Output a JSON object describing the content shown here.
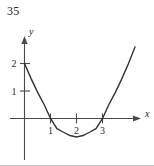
{
  "figure": {
    "number_label": "35",
    "axis_labels": {
      "x": "x",
      "y": "y"
    },
    "x_tick_labels": [
      "1",
      "2",
      "3"
    ],
    "y_tick_labels": [
      "1",
      "2"
    ],
    "colors": {
      "curve": "#333333",
      "axis": "#4a4a4a",
      "text": "#252525",
      "background": "#ffffff",
      "rule": "#c9c9c9"
    }
  },
  "chart_data": {
    "type": "line",
    "title": "",
    "subtitle": "",
    "xlabel": "x",
    "ylabel": "y",
    "xlim": [
      -0.55,
      4.5
    ],
    "ylim": [
      -1.6,
      2.95
    ],
    "xticks": [
      1,
      2,
      3
    ],
    "yticks": [
      1,
      2
    ],
    "xtick_labels": [
      "1",
      "2",
      "3"
    ],
    "ytick_labels": [
      "1",
      "2"
    ],
    "grid": false,
    "legend": null,
    "annotations": [
      {
        "text": "35",
        "role": "figure-number",
        "position": "top-left"
      }
    ],
    "series": [
      {
        "name": "parabola",
        "equation": "y = 0.667(x - 1)(x - 3)",
        "roots": [
          1,
          3
        ],
        "vertex": [
          2,
          -0.67
        ],
        "y_intercept": 2,
        "x": [
          0,
          0.25,
          0.5,
          0.75,
          1.0,
          1.25,
          1.5,
          1.75,
          2.0,
          2.25,
          2.5,
          2.75,
          3.0,
          3.25,
          3.5,
          3.75,
          4.0,
          4.25
        ],
        "y": [
          2.0,
          1.46,
          0.96,
          0.52,
          0.0,
          -0.37,
          -0.5,
          -0.62,
          -0.67,
          -0.62,
          -0.5,
          -0.37,
          0.0,
          0.52,
          0.96,
          1.46,
          2.0,
          2.6
        ]
      }
    ]
  }
}
